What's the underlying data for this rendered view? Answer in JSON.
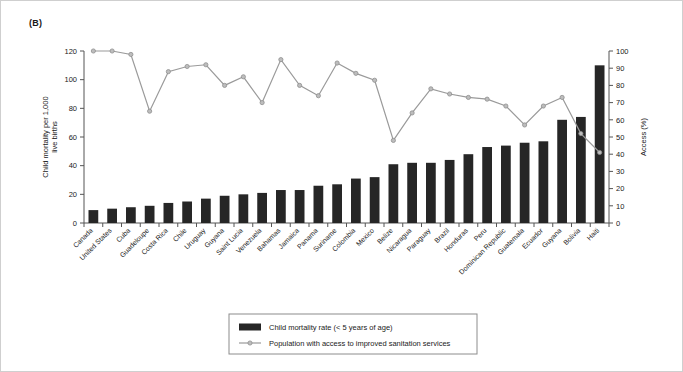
{
  "figure": {
    "panel_label": "(B)"
  },
  "chart_data": {
    "type": "bar",
    "title": "(B)",
    "xlabel": "",
    "ylabel": "Child mortality per 1,000 live births",
    "y2label": "Access (%)",
    "ylim": [
      0,
      120
    ],
    "y2lim": [
      0,
      100
    ],
    "yticks": [
      0,
      20,
      40,
      60,
      80,
      100,
      120
    ],
    "y2ticks": [
      0,
      10,
      20,
      30,
      40,
      50,
      60,
      70,
      80,
      90,
      100
    ],
    "grid": false,
    "legend_position": "bottom-center",
    "categories": [
      "Canada",
      "United States",
      "Cuba",
      "Guadeloupe",
      "Costa Rica",
      "Chile",
      "Uruguay",
      "Guyana",
      "Saint Lucia",
      "Venezuela",
      "Bahamas",
      "Jamaica",
      "Panama",
      "Suriname",
      "Colombia",
      "Mexico",
      "Belize",
      "Nicaragua",
      "Paraguay",
      "Brazil",
      "Honduras",
      "Peru",
      "Dominican Republic",
      "Guatemala",
      "Ecuador",
      "Guyana",
      "Bolivia",
      "Haiti"
    ],
    "series": [
      {
        "name": "Child mortality rate (< 5 years of age)",
        "type": "bar",
        "axis": "left",
        "unit": "per 1,000 live births",
        "color": "#262626",
        "values": [
          9,
          10,
          11,
          12,
          14,
          15,
          17,
          19,
          20,
          21,
          23,
          23,
          26,
          27,
          31,
          32,
          41,
          42,
          42,
          44,
          48,
          53,
          54,
          56,
          57,
          72,
          74,
          110
        ]
      },
      {
        "name": "Population with access to improved sanitation services",
        "type": "line",
        "axis": "right",
        "unit": "%",
        "color": "#9a9a9a",
        "marker_color": "#bdbdbd",
        "values": [
          100,
          100,
          98,
          65,
          88,
          91,
          92,
          80,
          85,
          70,
          95,
          80,
          74,
          93,
          87,
          83,
          48,
          64,
          78,
          75,
          73,
          72,
          68,
          57,
          68,
          73,
          52,
          41
        ]
      }
    ]
  },
  "legend": {
    "items": [
      {
        "label": "Child mortality rate (< 5 years of age)",
        "marker": "filled-rect",
        "color": "#262626"
      },
      {
        "label": "Population with access to improved sanitation services",
        "marker": "line-with-point",
        "color": "#9a9a9a"
      }
    ]
  }
}
